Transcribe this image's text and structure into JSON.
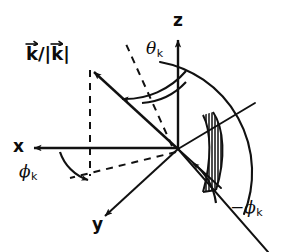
{
  "figure": {
    "kind": "vector-geometry-diagram",
    "background_color": "#ffffff",
    "ink_color": "#111111",
    "width": 287,
    "height": 252
  },
  "labels": {
    "k_unit_vector": {
      "numerator": "k",
      "slash": "/",
      "denominator_open": "|",
      "denominator": "k",
      "denominator_close": "|"
    },
    "z_axis": "z",
    "x_axis": "x",
    "y_axis": "y",
    "theta_k": {
      "symbol": "θ",
      "subscript": "k"
    },
    "phi_k": {
      "symbol": "ϕ",
      "subscript": "k"
    },
    "minus_phi_k": {
      "minus": "−",
      "symbol": "ϕ",
      "subscript": "k"
    }
  },
  "geometry": {
    "origin": {
      "x": 178,
      "y": 149
    },
    "z_axis_tip": {
      "x": 178,
      "y": 36
    },
    "x_axis_tip": {
      "x": 28,
      "y": 148
    },
    "y_axis_tip": {
      "x": 100,
      "y": 221
    },
    "k_vector_tip": {
      "x": 89,
      "y": 67
    },
    "fan_radius": 112,
    "hatch_line_count": 13
  },
  "colors": {
    "stroke": "#111111",
    "background": "#ffffff"
  }
}
